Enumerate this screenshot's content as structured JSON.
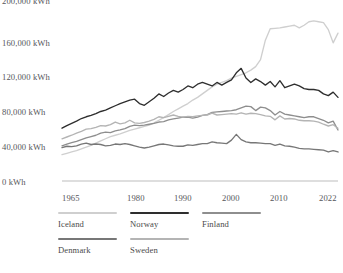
{
  "chart_data": {
    "type": "line",
    "title": "",
    "xlabel": "",
    "ylabel": "",
    "xlim": [
      1965,
      2022
    ],
    "ylim": [
      0,
      200000
    ],
    "grid": false,
    "legend_position": "bottom-left",
    "y_ticks": [
      0,
      40000,
      80000,
      120000,
      160000,
      200000
    ],
    "y_tick_labels": [
      "0 kWh",
      "40,000 kWh",
      "80,000 kWh",
      "120,000 kWh",
      "160,000 kWh",
      "200,000 kWh"
    ],
    "x_ticks": [
      1965,
      1980,
      1990,
      2000,
      2010,
      2022
    ],
    "x_tick_labels": [
      "1965",
      "1980",
      "1990",
      "2000",
      "2010",
      "2022"
    ],
    "x": [
      1965,
      1966,
      1967,
      1968,
      1969,
      1970,
      1971,
      1972,
      1973,
      1974,
      1975,
      1976,
      1977,
      1978,
      1979,
      1980,
      1981,
      1982,
      1983,
      1984,
      1985,
      1986,
      1987,
      1988,
      1989,
      1990,
      1991,
      1992,
      1993,
      1994,
      1995,
      1996,
      1997,
      1998,
      1999,
      2000,
      2001,
      2002,
      2003,
      2004,
      2005,
      2006,
      2007,
      2008,
      2009,
      2010,
      2011,
      2012,
      2013,
      2014,
      2015,
      2016,
      2017,
      2018,
      2019,
      2020,
      2021,
      2022
    ],
    "series": [
      {
        "name": "Iceland",
        "color": "#cfcfcf",
        "values": [
          30000,
          31500,
          33000,
          34500,
          36500,
          38500,
          40500,
          43000,
          45500,
          48000,
          50500,
          52000,
          53500,
          55500,
          57500,
          59000,
          60500,
          62000,
          63500,
          66000,
          69000,
          72000,
          75500,
          79000,
          82000,
          85000,
          88000,
          92000,
          95000,
          99000,
          103000,
          107000,
          110000,
          112000,
          114000,
          117000,
          119000,
          121000,
          123000,
          126000,
          130000,
          138000,
          160000,
          173000,
          173500,
          174000,
          175000,
          176000,
          177000,
          174000,
          177000,
          181000,
          182000,
          181000,
          180000,
          172000,
          157000,
          168000
        ]
      },
      {
        "name": "Norway",
        "color": "#2e2e2e",
        "values": [
          60000,
          63000,
          65500,
          68000,
          71000,
          73000,
          74500,
          76500,
          79000,
          80500,
          83000,
          85500,
          88000,
          90000,
          92000,
          93000,
          88000,
          86000,
          90000,
          94000,
          99000,
          96000,
          100000,
          103000,
          101000,
          104000,
          108000,
          106000,
          110000,
          112000,
          110000,
          108000,
          112000,
          109000,
          112000,
          115000,
          123000,
          128000,
          117000,
          112000,
          116000,
          113000,
          109000,
          113000,
          107000,
          114000,
          106000,
          108000,
          110000,
          108000,
          105000,
          104000,
          104000,
          103000,
          99000,
          97000,
          101000,
          95000
        ]
      },
      {
        "name": "Finland",
        "color": "#8e8e8e",
        "values": [
          40000,
          42000,
          43500,
          45000,
          47000,
          49000,
          50500,
          52000,
          54500,
          55500,
          55000,
          57000,
          58000,
          59500,
          62000,
          63500,
          63000,
          63500,
          64500,
          65500,
          67000,
          67500,
          69500,
          70500,
          71500,
          72500,
          72500,
          71500,
          72500,
          74500,
          75500,
          78000,
          78500,
          79000,
          79500,
          80000,
          81000,
          83000,
          85000,
          84500,
          80000,
          84000,
          83000,
          80000,
          75000,
          79000,
          76000,
          75000,
          74000,
          73000,
          72000,
          73000,
          73000,
          71000,
          69000,
          66000,
          68000,
          58000
        ]
      },
      {
        "name": "Denmark",
        "color": "#777777",
        "values": [
          38000,
          39500,
          39000,
          40000,
          42000,
          43000,
          41500,
          42000,
          41500,
          40000,
          40500,
          42000,
          41500,
          42500,
          41500,
          40000,
          38500,
          37500,
          38500,
          40000,
          41500,
          42000,
          41000,
          40000,
          39500,
          39500,
          41000,
          40500,
          41500,
          42500,
          42500,
          44500,
          43500,
          43000,
          42500,
          46500,
          53000,
          47000,
          44500,
          43500,
          43500,
          43000,
          42500,
          42500,
          40500,
          42000,
          40000,
          39500,
          38500,
          37000,
          36500,
          36500,
          36000,
          35500,
          35000,
          33000,
          34500,
          33000
        ]
      },
      {
        "name": "Sweden",
        "color": "#b4b4b4",
        "values": [
          48000,
          50000,
          52000,
          54500,
          56500,
          59000,
          59500,
          61000,
          63000,
          62500,
          64000,
          67000,
          65000,
          66000,
          69000,
          66000,
          65500,
          66500,
          68000,
          70000,
          73000,
          72000,
          73500,
          75000,
          73500,
          72500,
          73500,
          73000,
          74000,
          74500,
          75000,
          77000,
          75000,
          75500,
          76000,
          76500,
          76000,
          77500,
          76000,
          77000,
          76500,
          75500,
          74000,
          73500,
          69500,
          74000,
          70500,
          71000,
          70500,
          69000,
          68500,
          68500,
          68000,
          67000,
          64500,
          62500,
          64000,
          60000
        ]
      }
    ]
  },
  "axis": {
    "y_labels": [
      "200,000 kWh",
      "160,000 kWh",
      "120,000 kWh",
      "80,000 kWh",
      "40,000 kWh",
      "0 kWh"
    ],
    "x_labels": [
      "1965",
      "1980",
      "1990",
      "2000",
      "2010",
      "2022"
    ]
  },
  "legend": {
    "rows": [
      [
        {
          "label": "Iceland",
          "color": "#cfcfcf"
        },
        {
          "label": "Norway",
          "color": "#2e2e2e"
        },
        {
          "label": "Finland",
          "color": "#8e8e8e"
        }
      ],
      [
        {
          "label": "Denmark",
          "color": "#777777"
        },
        {
          "label": "Sweden",
          "color": "#b4b4b4"
        }
      ]
    ]
  },
  "colors": {
    "axis_line": "#bdbdbd",
    "tick_text": "#55555a",
    "background": "#ffffff"
  }
}
